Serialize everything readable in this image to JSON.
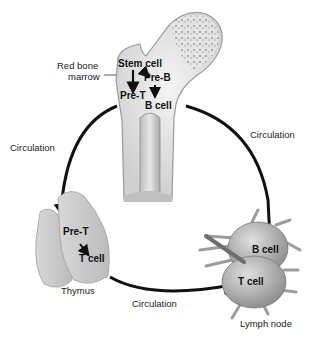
{
  "diagram": {
    "bone": {
      "label_line1": "Red bone",
      "label_line2": "marrow",
      "stem_cell": "Stem cell",
      "pre_b": "Pre-B",
      "pre_t": "Pre-T",
      "b_cell": "B cell"
    },
    "circulation_left": "Circulation",
    "circulation_right": "Circulation",
    "circulation_bottom": "Circulation",
    "thymus": {
      "name": "Thymus",
      "pre_t": "Pre-T",
      "t_cell": "T cell"
    },
    "lymph_node": {
      "name": "Lymph node",
      "b_cell": "B cell",
      "t_cell": "T cell"
    }
  }
}
